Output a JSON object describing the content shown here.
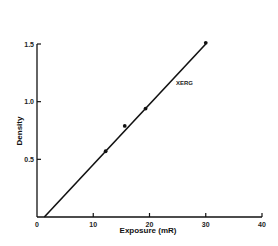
{
  "chart_data": {
    "type": "line",
    "title": "",
    "xlabel": "Exposure (mR)",
    "ylabel": "Density",
    "xlim": [
      0,
      40
    ],
    "ylim": [
      0,
      1.5
    ],
    "x_ticks": [
      0,
      10,
      20,
      30,
      40
    ],
    "x_tick_labels": [
      "0",
      "10",
      "20",
      "30",
      "40"
    ],
    "y_ticks": [
      0.5,
      1.0,
      1.5
    ],
    "y_tick_labels": [
      "0.5",
      "1.0",
      "1.5"
    ],
    "grid": false,
    "legend": null,
    "series": [
      {
        "name": "XERG",
        "kind": "fit-line",
        "x": [
          1.3,
          30
        ],
        "y": [
          0.0,
          1.5
        ]
      },
      {
        "name": "XERG data",
        "kind": "points",
        "x": [
          12.2,
          15.6,
          19.3,
          30
        ],
        "y": [
          0.57,
          0.79,
          0.94,
          1.51
        ]
      }
    ],
    "annotations": [
      {
        "text": "XERG",
        "x": 25,
        "y": 1.22
      }
    ]
  },
  "colors": {
    "ink": "#111111",
    "background": "#ffffff"
  }
}
